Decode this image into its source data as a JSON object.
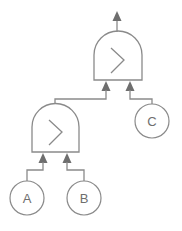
{
  "diagram": {
    "type": "expression-tree",
    "colors": {
      "line": "#8a8a8a",
      "arrow": "#6e6e6e",
      "background": "#ffffff"
    },
    "gates": [
      {
        "id": "gate-top",
        "operator": ">",
        "operator_icon": "greater-than-icon"
      },
      {
        "id": "gate-bottom",
        "operator": ">",
        "operator_icon": "greater-than-icon"
      }
    ],
    "inputs": [
      {
        "id": "input-a",
        "label": "A"
      },
      {
        "id": "input-b",
        "label": "B"
      },
      {
        "id": "input-c",
        "label": "C"
      }
    ],
    "edges": [
      {
        "from": "input-a",
        "to": "gate-bottom"
      },
      {
        "from": "input-b",
        "to": "gate-bottom"
      },
      {
        "from": "gate-bottom",
        "to": "gate-top"
      },
      {
        "from": "input-c",
        "to": "gate-top"
      },
      {
        "from": "gate-top",
        "to": "output"
      }
    ]
  }
}
